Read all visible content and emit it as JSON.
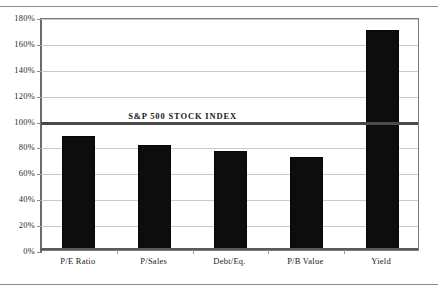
{
  "chart_data": {
    "type": "bar",
    "title": "",
    "xlabel": "",
    "ylabel": "",
    "categories": [
      "P/E Ratio",
      "P/Sales",
      "Debt/Eq.",
      "P/B Value",
      "Yield"
    ],
    "values": [
      87,
      80,
      76,
      71,
      169
    ],
    "ylim": [
      0,
      180
    ],
    "ytick_values": [
      0,
      20,
      40,
      60,
      80,
      100,
      120,
      140,
      160,
      180
    ],
    "ytick_labels": [
      "0%",
      "20%",
      "40%",
      "60%",
      "80%",
      "100%",
      "120%",
      "140%",
      "160%",
      "180%"
    ],
    "grid": true,
    "legend": "none",
    "bar_color": "#0d0d0d",
    "annotations": [
      {
        "name": "benchmark",
        "label": "S&P 500 STOCK INDEX",
        "value": 100,
        "color": "#4a4a4a"
      }
    ]
  },
  "colors": {
    "bar": "#0d0d0d",
    "benchmark": "#4a4a4a",
    "grid": "#c9c9c9",
    "axis": "#5a5a5a",
    "frame": "#8c8c8c",
    "background": "#ffffff"
  }
}
